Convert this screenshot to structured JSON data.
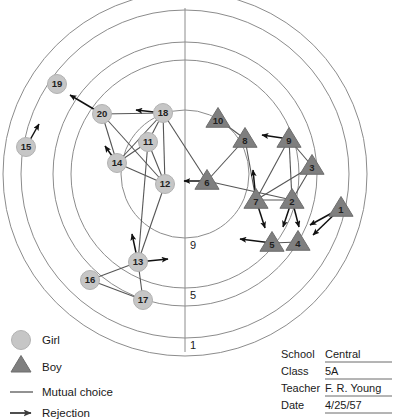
{
  "chart_data": {
    "type": "scatter",
    "center": {
      "x": 185,
      "y": 174
    },
    "rings": [
      {
        "label": "9",
        "radius": 64
      },
      {
        "label": "5",
        "radius": 114
      },
      {
        "label": "1",
        "radius": 164
      }
    ],
    "extra_rings": [
      {
        "label": "",
        "radius": 132
      },
      {
        "label": "",
        "radius": 182
      }
    ],
    "ring_label_axis": "vertical-below-center",
    "axis": {
      "vertical": true,
      "x": 185,
      "y1": 8,
      "y2": 352
    },
    "legend_position": "bottom-left",
    "nodes": [
      {
        "id": "19",
        "sex": "girl",
        "x": 57,
        "y": 84
      },
      {
        "id": "15",
        "sex": "girl",
        "x": 26,
        "y": 147
      },
      {
        "id": "20",
        "sex": "girl",
        "x": 102,
        "y": 114
      },
      {
        "id": "18",
        "sex": "girl",
        "x": 163,
        "y": 113
      },
      {
        "id": "11",
        "sex": "girl",
        "x": 148,
        "y": 142
      },
      {
        "id": "14",
        "sex": "girl",
        "x": 117,
        "y": 163
      },
      {
        "id": "12",
        "sex": "girl",
        "x": 165,
        "y": 184
      },
      {
        "id": "13",
        "sex": "girl",
        "x": 138,
        "y": 262
      },
      {
        "id": "16",
        "sex": "girl",
        "x": 90,
        "y": 280
      },
      {
        "id": "17",
        "sex": "girl",
        "x": 143,
        "y": 300
      },
      {
        "id": "10",
        "sex": "boy",
        "x": 218,
        "y": 119
      },
      {
        "id": "8",
        "sex": "boy",
        "x": 245,
        "y": 139
      },
      {
        "id": "9",
        "sex": "boy",
        "x": 289,
        "y": 139
      },
      {
        "id": "3",
        "sex": "boy",
        "x": 312,
        "y": 166
      },
      {
        "id": "6",
        "sex": "boy",
        "x": 207,
        "y": 181
      },
      {
        "id": "7",
        "sex": "boy",
        "x": 256,
        "y": 200
      },
      {
        "id": "2",
        "sex": "boy",
        "x": 292,
        "y": 200
      },
      {
        "id": "1",
        "sex": "boy",
        "x": 341,
        "y": 208
      },
      {
        "id": "5",
        "sex": "boy",
        "x": 272,
        "y": 243
      },
      {
        "id": "4",
        "sex": "boy",
        "x": 298,
        "y": 242
      }
    ],
    "mutual_choices": [
      [
        "20",
        "18"
      ],
      [
        "20",
        "14"
      ],
      [
        "20",
        "12"
      ],
      [
        "18",
        "11"
      ],
      [
        "18",
        "14"
      ],
      [
        "18",
        "12"
      ],
      [
        "18",
        "6"
      ],
      [
        "11",
        "14"
      ],
      [
        "11",
        "12"
      ],
      [
        "14",
        "12"
      ],
      [
        "12",
        "13"
      ],
      [
        "11",
        "13"
      ],
      [
        "13",
        "16"
      ],
      [
        "13",
        "17"
      ],
      [
        "16",
        "17"
      ],
      [
        "10",
        "8"
      ],
      [
        "8",
        "6"
      ],
      [
        "8",
        "7"
      ],
      [
        "9",
        "7"
      ],
      [
        "9",
        "2"
      ],
      [
        "9",
        "3"
      ],
      [
        "3",
        "2"
      ],
      [
        "3",
        "7"
      ],
      [
        "7",
        "2"
      ],
      [
        "6",
        "2"
      ],
      [
        "5",
        "4"
      ]
    ],
    "rejections": [
      {
        "from": "20",
        "to_x": 70,
        "to_y": 95
      },
      {
        "from": "18",
        "to_x": 136,
        "to_y": 110
      },
      {
        "from": "14",
        "to_x": 105,
        "to_y": 146
      },
      {
        "from": "15",
        "to_x": 39,
        "to_y": 124
      },
      {
        "from": "13",
        "to_x": 132,
        "to_y": 234
      },
      {
        "from": "13",
        "to_x": 168,
        "to_y": 259
      },
      {
        "from": "6",
        "to_x": 184,
        "to_y": 181
      },
      {
        "from": "9",
        "to_x": 262,
        "to_y": 135
      },
      {
        "from": "7",
        "to_x": 253,
        "to_y": 170
      },
      {
        "from": "7",
        "to_x": 265,
        "to_y": 228
      },
      {
        "from": "2",
        "to_x": 283,
        "to_y": 227
      },
      {
        "from": "2",
        "to_x": 299,
        "to_y": 227
      },
      {
        "from": "1",
        "to_x": 310,
        "to_y": 225
      },
      {
        "from": "1",
        "to_x": 313,
        "to_y": 235
      },
      {
        "from": "5",
        "to_x": 240,
        "to_y": 239
      }
    ]
  },
  "legend": {
    "items": [
      {
        "symbol": "circle",
        "label": "Girl"
      },
      {
        "symbol": "triangle",
        "label": "Boy"
      },
      {
        "symbol": "line",
        "label": "Mutual choice"
      },
      {
        "symbol": "arrow",
        "label": "Rejection"
      }
    ]
  },
  "form": {
    "rows": [
      {
        "label": "School",
        "value": "Central"
      },
      {
        "label": "Class",
        "value": "5A"
      },
      {
        "label": "Teacher",
        "value": "F. R. Young"
      },
      {
        "label": "Date",
        "value": "4/25/57"
      }
    ]
  },
  "colors": {
    "girl_fill": "#c6c6c6",
    "boy_fill": "#7f7f7f",
    "ring_stroke": "#8c8c8c",
    "edge_stroke": "#555555",
    "reject_stroke": "#111111",
    "text": "#1a1a1a"
  }
}
